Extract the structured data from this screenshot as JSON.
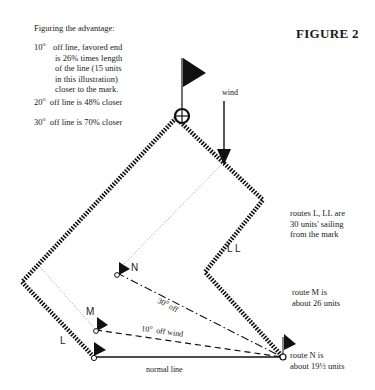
{
  "figure": {
    "title": "FIGURE 2"
  },
  "advantage": {
    "heading": "Figuring the advantage:",
    "item1": {
      "degrees": "10",
      "lines": [
        "off line, favored end",
        "is 26% times length",
        "of the line (15 units",
        "in this illustration)",
        "closer to the mark."
      ]
    },
    "item2": {
      "degrees": "20",
      "text": "off line is 48% closer"
    },
    "item3": {
      "degrees": "30",
      "text": "off line is 70% closer"
    },
    "degree_symbol": "o"
  },
  "labels": {
    "wind": "wind",
    "route_ll": "L L",
    "route_l": "L",
    "point_m": "M",
    "point_n": "N",
    "line_30": "30",
    "line_30_suffix": "off",
    "line_10": "10",
    "line_10_suffix": "off wind",
    "normal_line": "normal line"
  },
  "notes": {
    "routes_l_ll": [
      "routes L, LL are",
      "30 units' sailing",
      "from the mark"
    ],
    "route_m": [
      "route M is",
      "about 26 units"
    ],
    "route_n": [
      "route N is",
      "about 19½ units"
    ]
  }
}
